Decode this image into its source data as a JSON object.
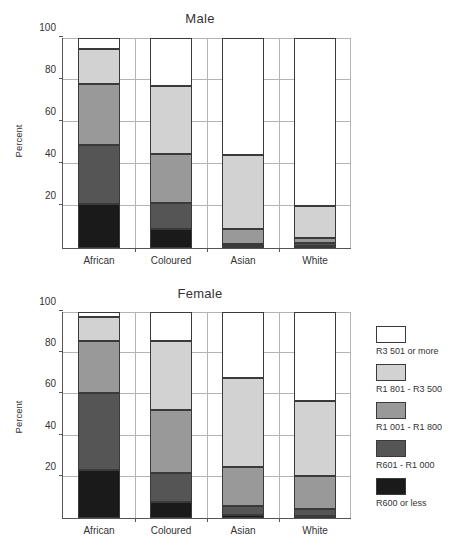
{
  "chart_data": [
    {
      "type": "bar",
      "title": "Male",
      "xlabel": "",
      "ylabel": "Percent",
      "ylim": [
        0,
        100
      ],
      "yticks": [
        0,
        20,
        40,
        60,
        80,
        100
      ],
      "ytick_labels": [
        "",
        "20",
        "40",
        "60",
        "80",
        "100"
      ],
      "grid": true,
      "stacked": true,
      "categories": [
        "African",
        "Coloured",
        "Asian",
        "White"
      ],
      "series": [
        {
          "name": "R600 or less",
          "color": "#1a1a1a",
          "values": [
            21.0,
            9.0,
            1.0,
            1.0
          ]
        },
        {
          "name": "R601 -  R1 000",
          "color": "#555555",
          "values": [
            28.0,
            12.5,
            1.0,
            1.5
          ]
        },
        {
          "name": "R1 001 - R1 800",
          "color": "#999999",
          "values": [
            29.0,
            23.5,
            7.0,
            2.5
          ]
        },
        {
          "name": "R1 801 - R3 500",
          "color": "#d2d2d2",
          "values": [
            17.0,
            32.0,
            35.5,
            15.0
          ]
        },
        {
          "name": "R3 501 or more",
          "color": "#ffffff",
          "values": [
            5.0,
            23.0,
            55.5,
            80.0
          ]
        }
      ],
      "cumulative_tops": {
        "African": [
          21.0,
          49.0,
          78.0,
          95.0,
          100.0
        ],
        "Coloured": [
          9.0,
          21.5,
          45.0,
          77.0,
          100.0
        ],
        "Asian": [
          1.0,
          2.0,
          9.0,
          44.5,
          100.0
        ],
        "White": [
          1.0,
          2.5,
          5.0,
          20.0,
          100.0
        ]
      }
    },
    {
      "type": "bar",
      "title": "Female",
      "xlabel": "",
      "ylabel": "Percent",
      "ylim": [
        0,
        100
      ],
      "yticks": [
        0,
        20,
        40,
        60,
        80,
        100
      ],
      "ytick_labels": [
        "",
        "20",
        "40",
        "60",
        "80",
        "100"
      ],
      "grid": true,
      "stacked": true,
      "categories": [
        "African",
        "Coloured",
        "Asian",
        "White"
      ],
      "series": [
        {
          "name": "R600 or less",
          "color": "#1a1a1a",
          "values": [
            23.5,
            8.0,
            1.5,
            1.0
          ]
        },
        {
          "name": "R601 -  R1 000",
          "color": "#555555",
          "values": [
            37.0,
            14.0,
            4.5,
            3.5
          ]
        },
        {
          "name": "R1 001 - R1 800",
          "color": "#999999",
          "values": [
            25.5,
            30.5,
            19.0,
            16.0
          ]
        },
        {
          "name": "R1 801 - R3 500",
          "color": "#d2d2d2",
          "values": [
            11.5,
            33.5,
            43.0,
            36.5
          ]
        },
        {
          "name": "R3 501 or more",
          "color": "#ffffff",
          "values": [
            2.5,
            14.0,
            32.0,
            43.0
          ]
        }
      ],
      "cumulative_tops": {
        "African": [
          23.5,
          60.5,
          86.0,
          97.5,
          100.0
        ],
        "Coloured": [
          8.0,
          22.0,
          52.5,
          86.0,
          100.0
        ],
        "Asian": [
          1.5,
          6.0,
          25.0,
          68.0,
          100.0
        ],
        "White": [
          1.0,
          4.5,
          20.5,
          57.0,
          100.0
        ]
      }
    }
  ],
  "male": {
    "title": "Male",
    "ylabel": "Percent",
    "yticks": [
      "100",
      "80",
      "60",
      "40",
      "20"
    ],
    "categories": [
      "African",
      "Coloured",
      "Asian",
      "White"
    ]
  },
  "female": {
    "title": "Female",
    "ylabel": "Percent",
    "yticks": [
      "100",
      "80",
      "60",
      "40",
      "20"
    ],
    "categories": [
      "African",
      "Coloured",
      "Asian",
      "White"
    ]
  },
  "legend": {
    "items": [
      {
        "label": "R3 501 or more",
        "color": "#ffffff"
      },
      {
        "label": "R1 801 - R3 500",
        "color": "#d2d2d2"
      },
      {
        "label": "R1 001 - R1 800",
        "color": "#999999"
      },
      {
        "label": "R601 -  R1 000",
        "color": "#555555"
      },
      {
        "label": "R600 or less",
        "color": "#1a1a1a"
      }
    ]
  }
}
